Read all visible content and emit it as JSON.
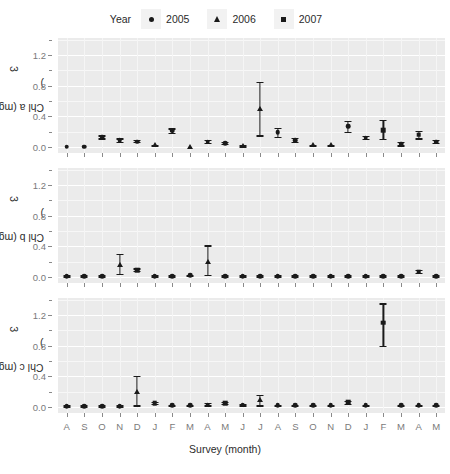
{
  "legend": {
    "title": "Year",
    "entries": [
      {
        "label": "2005",
        "glyph": "circle-glyph"
      },
      {
        "label": "2006",
        "glyph": "triangle-glyph"
      },
      {
        "label": "2007",
        "glyph": "square-glyph"
      }
    ]
  },
  "axis": {
    "xlabel": "Survey (month)",
    "xticklabels": [
      "A",
      "S",
      "O",
      "N",
      "D",
      "J",
      "F",
      "M",
      "A",
      "M",
      "J",
      "J",
      "A",
      "S",
      "O",
      "N",
      "D",
      "J",
      "F",
      "M",
      "A",
      "M"
    ],
    "yticklabels": [
      "0.0",
      "0.4",
      "0.8",
      "1.2"
    ],
    "ylim": [
      -0.08,
      1.42
    ],
    "ymajor": [
      0.0,
      0.4,
      0.8,
      1.2
    ],
    "yminor": [
      0.2,
      0.6,
      1.0,
      1.4
    ]
  },
  "chart_data": [
    {
      "type": "scatter",
      "title": "",
      "ylabel": "Chl a  (mg/ m3)",
      "xlabel": "Survey (month)",
      "ylim": [
        -0.08,
        1.42
      ],
      "grid": true,
      "legend_position": "top",
      "categories": [
        "A",
        "S",
        "O",
        "N",
        "D",
        "J",
        "F",
        "M",
        "A",
        "M",
        "J",
        "J",
        "A",
        "S",
        "O",
        "N",
        "D",
        "J",
        "F",
        "M",
        "A",
        "M"
      ],
      "series": [
        {
          "name": "Chl a",
          "values": [
            0.0,
            0.0,
            0.13,
            0.09,
            0.07,
            0.02,
            0.21,
            0.0,
            0.07,
            0.05,
            0.01,
            0.5,
            0.19,
            0.09,
            0.02,
            0.02,
            0.27,
            0.12,
            0.22,
            0.04,
            0.16,
            0.07,
            0.06
          ],
          "err_low": [
            0.0,
            0.0,
            0.11,
            0.07,
            0.06,
            0.01,
            0.18,
            0.0,
            0.05,
            0.04,
            0.0,
            0.15,
            0.13,
            0.07,
            0.01,
            0.01,
            0.2,
            0.1,
            0.1,
            0.02,
            0.11,
            0.05,
            0.04
          ],
          "err_high": [
            0.0,
            0.0,
            0.15,
            0.11,
            0.09,
            0.03,
            0.24,
            0.0,
            0.09,
            0.07,
            0.02,
            0.85,
            0.25,
            0.12,
            0.03,
            0.03,
            0.34,
            0.14,
            0.35,
            0.06,
            0.21,
            0.09,
            0.08
          ],
          "markers": [
            "circle",
            "circle",
            "circle",
            "circle",
            "circle",
            "triangle",
            "circle",
            "triangle",
            "circle",
            "circle",
            "triangle",
            "triangle",
            "circle",
            "circle",
            "triangle",
            "triangle",
            "circle",
            "circle",
            "square",
            "circle",
            "square",
            "circle",
            "circle"
          ]
        }
      ]
    },
    {
      "type": "scatter",
      "title": "",
      "ylabel": "Chl b  (mg/ m3)",
      "xlabel": "Survey (month)",
      "ylim": [
        -0.08,
        1.42
      ],
      "grid": true,
      "legend_position": "top",
      "categories": [
        "A",
        "S",
        "O",
        "N",
        "D",
        "J",
        "F",
        "M",
        "A",
        "M",
        "J",
        "J",
        "A",
        "S",
        "O",
        "N",
        "D",
        "J",
        "F",
        "M",
        "A",
        "M"
      ],
      "series": [
        {
          "name": "Chl b",
          "values": [
            0.01,
            0.01,
            0.01,
            0.15,
            0.09,
            0.01,
            0.01,
            0.02,
            0.2,
            0.01,
            0.01,
            0.01,
            0.01,
            0.01,
            0.01,
            0.01,
            0.01,
            0.01,
            0.01,
            0.01,
            0.07,
            0.01
          ],
          "err_low": [
            0.0,
            0.0,
            0.0,
            0.04,
            0.08,
            0.0,
            0.0,
            0.01,
            0.03,
            0.0,
            0.0,
            0.0,
            0.0,
            0.0,
            0.0,
            0.0,
            0.0,
            0.0,
            0.0,
            0.0,
            0.05,
            0.0
          ],
          "err_high": [
            0.02,
            0.02,
            0.02,
            0.3,
            0.11,
            0.02,
            0.02,
            0.03,
            0.41,
            0.02,
            0.02,
            0.02,
            0.02,
            0.02,
            0.02,
            0.02,
            0.02,
            0.02,
            0.02,
            0.02,
            0.09,
            0.02
          ],
          "markers": [
            "circle",
            "circle",
            "circle",
            "triangle",
            "square",
            "circle",
            "circle",
            "circle",
            "triangle",
            "circle",
            "circle",
            "circle",
            "circle",
            "circle",
            "circle",
            "circle",
            "circle",
            "circle",
            "circle",
            "circle",
            "square",
            "circle"
          ]
        }
      ]
    },
    {
      "type": "scatter",
      "title": "",
      "ylabel": "Chl c  (mg/ m3)",
      "xlabel": "Survey (month)",
      "ylim": [
        -0.08,
        1.42
      ],
      "grid": true,
      "legend_position": "top",
      "categories": [
        "A",
        "S",
        "O",
        "N",
        "D",
        "J",
        "F",
        "M",
        "A",
        "M",
        "J",
        "J",
        "A",
        "S",
        "O",
        "N",
        "D",
        "J",
        "F",
        "M",
        "A",
        "M"
      ],
      "series": [
        {
          "name": "Chl c",
          "values": [
            0.01,
            0.01,
            0.01,
            0.01,
            0.2,
            0.05,
            0.02,
            0.02,
            0.03,
            0.05,
            0.03,
            0.09,
            0.02,
            0.02,
            0.02,
            0.02,
            0.06,
            0.02,
            1.1,
            0.02,
            0.02,
            0.02
          ],
          "err_low": [
            0.0,
            0.0,
            0.0,
            0.0,
            0.02,
            0.04,
            0.01,
            0.01,
            0.02,
            0.04,
            0.02,
            0.02,
            0.01,
            0.01,
            0.01,
            0.01,
            0.04,
            0.01,
            0.8,
            0.01,
            0.01,
            0.01
          ],
          "err_high": [
            0.02,
            0.02,
            0.02,
            0.02,
            0.4,
            0.07,
            0.03,
            0.03,
            0.05,
            0.07,
            0.04,
            0.16,
            0.03,
            0.03,
            0.03,
            0.03,
            0.08,
            0.03,
            1.35,
            0.03,
            0.03,
            0.03
          ],
          "markers": [
            "circle",
            "circle",
            "circle",
            "circle",
            "triangle",
            "square",
            "circle",
            "circle",
            "circle",
            "square",
            "circle",
            "triangle",
            "circle",
            "circle",
            "circle",
            "circle",
            "square",
            "circle",
            "square",
            "circle",
            "circle",
            "circle"
          ]
        }
      ]
    }
  ]
}
